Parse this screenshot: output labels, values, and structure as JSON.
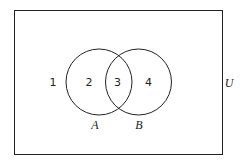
{
  "diagram": {
    "type": "venn",
    "universe_label": "U",
    "sets": [
      {
        "name": "A",
        "label": "A"
      },
      {
        "name": "B",
        "label": "B"
      }
    ],
    "regions": [
      {
        "id": "outside",
        "label": "1"
      },
      {
        "id": "A-only",
        "label": "2"
      },
      {
        "id": "A-and-B",
        "label": "3"
      },
      {
        "id": "B-only",
        "label": "4"
      }
    ],
    "colors": {
      "stroke": "#222222",
      "background": "#ffffff"
    }
  }
}
